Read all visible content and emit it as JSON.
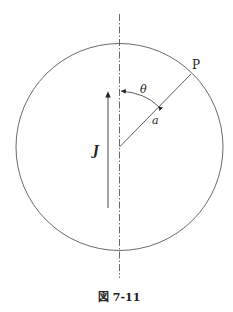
{
  "diagram": {
    "point_label": "P",
    "angle_label": "θ",
    "radius_label": "a",
    "current_label": "J",
    "caption": "図 7-11"
  },
  "colors": {
    "stroke": "#444444",
    "text": "#222222"
  }
}
